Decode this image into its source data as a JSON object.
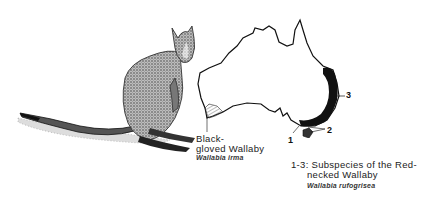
{
  "illustration": {
    "subject": "wallaby-drawing"
  },
  "map": {
    "region": "Australia",
    "labels": {
      "one": "1",
      "two": "2",
      "three": "3"
    },
    "colors": {
      "outline": "#111111",
      "range_fill": "#111111",
      "hatch": "#555555"
    }
  },
  "captions": {
    "black_gloved": {
      "line1": "Black-",
      "line2": "gloved Wallaby",
      "latin": "Wallabia irma"
    },
    "red_necked": {
      "line1": "1-3: Subspecies of the Red-",
      "line2": "necked Wallaby",
      "latin": "Wallabia rufogrisea"
    }
  }
}
